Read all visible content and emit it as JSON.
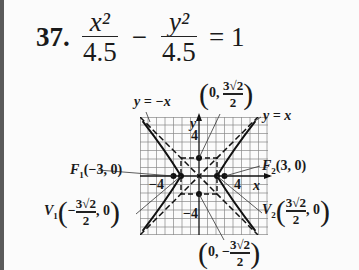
{
  "problem": {
    "number": "37.",
    "term1": {
      "numerator": "x²",
      "denominator": "4.5"
    },
    "operator": "−",
    "term2": {
      "numerator": "y²",
      "denominator": "4.5"
    },
    "equals": "= 1"
  },
  "graph": {
    "asymptote_neg": "y = −x",
    "asymptote_pos": "y = x",
    "axis_x": "x",
    "axis_y": "y",
    "tick_pos_y": "4",
    "tick_neg_y": "−4",
    "tick_pos_x": "4",
    "tick_neg_x": "−4",
    "focus1": {
      "name": "F",
      "sub": "1",
      "coords": "(−3, 0)"
    },
    "focus2": {
      "name": "F",
      "sub": "2",
      "coords": "(3, 0)"
    },
    "vertex1": {
      "name": "V",
      "sub": "1",
      "num": "3√2",
      "den": "2",
      "sign": "−",
      "y": ", 0"
    },
    "vertex2": {
      "name": "V",
      "sub": "2",
      "num": "3√2",
      "den": "2",
      "sign": "",
      "y": ", 0"
    },
    "covertex_top": {
      "x": "0,",
      "num": "3√2",
      "den": "2",
      "sign": ""
    },
    "covertex_bottom": {
      "x": "0,",
      "num": "3√2",
      "den": "2",
      "sign": "−"
    }
  }
}
